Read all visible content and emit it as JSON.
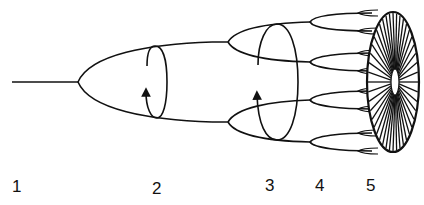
{
  "diagram": {
    "type": "branching-stages",
    "stroke_color": "#111111",
    "background": "#ffffff",
    "labels": [
      {
        "id": "stage-1",
        "text": "1",
        "x": 12,
        "y": 178
      },
      {
        "id": "stage-2",
        "text": "2",
        "x": 152,
        "y": 180
      },
      {
        "id": "stage-3",
        "text": "3",
        "x": 265,
        "y": 177
      },
      {
        "id": "stage-4",
        "text": "4",
        "x": 315,
        "y": 177
      },
      {
        "id": "stage-5",
        "text": "5",
        "x": 366,
        "y": 177
      }
    ],
    "elements": [
      {
        "stage": "1",
        "description": "single stem line"
      },
      {
        "stage": "2",
        "description": "first bifurcation with rotation arrow"
      },
      {
        "stage": "3",
        "description": "second bifurcation into four branches with rotation arrow"
      },
      {
        "stage": "4",
        "description": "third bifurcation into eight tips"
      },
      {
        "stage": "5",
        "description": "radial disk of many spokes"
      }
    ]
  }
}
